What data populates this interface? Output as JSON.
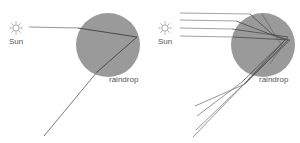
{
  "diagram": {
    "colors": {
      "drop_fill": "#9a9a9a",
      "ray": "#4a4a4a",
      "ray_light": "#8a8a8a",
      "sun": "#888888"
    },
    "panels": [
      {
        "id": "single-ray",
        "sun_label": "Sun",
        "drop_label": "raindrop",
        "drop": {
          "cx": 108,
          "cy": 45,
          "r": 32
        },
        "rays": [
          {
            "points": [
              [
                29,
                27
              ],
              [
                78,
                28
              ],
              [
                137,
                37
              ],
              [
                97,
                72
              ],
              [
                44,
                136
              ]
            ]
          }
        ]
      },
      {
        "id": "multiple-rays",
        "sun_label": "Sun",
        "drop_label": "raindrop",
        "drop": {
          "cx": 263,
          "cy": 45,
          "r": 32
        },
        "rays": [
          {
            "points": [
              [
                180,
                13
              ],
              [
                250,
                14
              ],
              [
                272,
                34
              ],
              [
                288,
                40
              ],
              [
                245,
                84
              ],
              [
                195,
                106
              ]
            ]
          },
          {
            "points": [
              [
                180,
                20
              ],
              [
                236,
                21
              ],
              [
                285,
                40
              ],
              [
                242,
                82
              ],
              [
                197,
                116
              ]
            ]
          },
          {
            "points": [
              [
                180,
                28
              ],
              [
                232,
                29
              ],
              [
                288,
                37
              ],
              [
                246,
                82
              ],
              [
                196,
                130
              ]
            ]
          },
          {
            "points": [
              [
                180,
                36
              ],
              [
                233,
                37
              ],
              [
                290,
                40
              ],
              [
                248,
                80
              ],
              [
                193,
                137
              ]
            ]
          }
        ]
      }
    ]
  }
}
